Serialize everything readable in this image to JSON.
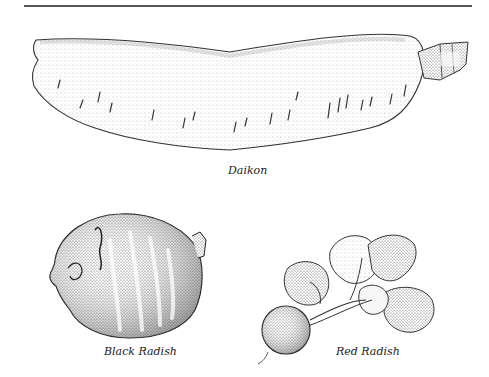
{
  "page": {
    "top_rule": true
  },
  "illustrations": [
    {
      "id": "daikon",
      "caption": "Daikon"
    },
    {
      "id": "black-radish",
      "caption": "Black Radish"
    },
    {
      "id": "red-radish",
      "caption": "Red Radish"
    }
  ],
  "colors": {
    "ink": "#222222",
    "rule": "#555555",
    "background": "#ffffff"
  }
}
